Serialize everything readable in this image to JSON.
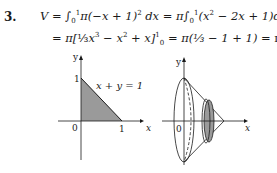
{
  "problem_number": "3.",
  "equations": {
    "line1_lhs": "V",
    "line1_int1": "∫",
    "line1_lower": "0",
    "line1_upper": "1",
    "line1_integrand1": "π(−x + 1)",
    "line1_exp": "2",
    "line1_dx1": " dx = π",
    "line1_int2": "∫",
    "line1_integrand2": "(x",
    "line1_sq": "2",
    "line1_rest": " − 2x + 1)dx",
    "line2_text1": "= π[",
    "line2_frac": "⅓",
    "line2_text2": "x",
    "line2_cube": "3",
    "line2_text3": " − x",
    "line2_sq": "2",
    "line2_text4": " + x]",
    "line2_upper": "1",
    "line2_lower": "0",
    "line2_text5": " = π(⅓ − 1 + 1) = ",
    "line2_result": "π/3"
  },
  "figure_left": {
    "y_label": "y",
    "x_label": "x",
    "origin_label": "0",
    "y_tick": "1",
    "x_tick": "1",
    "curve_label": "x + y = 1"
  },
  "figure_right": {
    "y_label": "y",
    "x_label": "x",
    "origin_label": "0"
  },
  "colors": {
    "shade": "#9a9a9a",
    "ink": "#1a1a1a"
  }
}
